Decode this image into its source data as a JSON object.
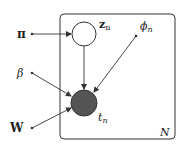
{
  "diagram": {
    "type": "plate-notation",
    "plate": {
      "label": "N"
    },
    "nodes": [
      {
        "id": "z",
        "label_main": "z",
        "label_sub": "n",
        "observed": false
      },
      {
        "id": "t",
        "label_main": "t",
        "label_sub": "n",
        "observed": true
      }
    ],
    "params": [
      {
        "id": "pi",
        "label": "π"
      },
      {
        "id": "phi",
        "label_main": "ϕ",
        "label_sub": "n"
      },
      {
        "id": "beta",
        "label": "β"
      },
      {
        "id": "W",
        "label": "W"
      }
    ],
    "edges": [
      {
        "from": "pi",
        "to": "z"
      },
      {
        "from": "z",
        "to": "t"
      },
      {
        "from": "phi",
        "to": "t"
      },
      {
        "from": "beta",
        "to": "t"
      },
      {
        "from": "W",
        "to": "t"
      }
    ],
    "colors": {
      "line": "#333333",
      "observed_fill": "#555555",
      "plate": "#333333"
    }
  }
}
